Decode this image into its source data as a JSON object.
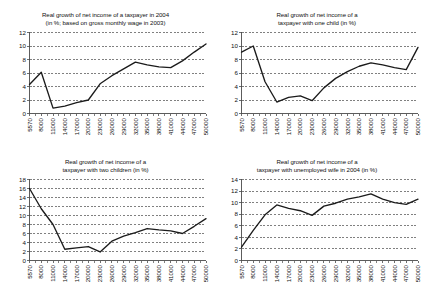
{
  "figure": {
    "background": "#ffffff",
    "line_color": "#1b1b1b",
    "axis_color": "#4a4a4a",
    "panel_count": 4
  },
  "chart_data": [
    {
      "type": "line",
      "panel": "top-left",
      "title": "Real growth of net income of a taxpayer in 2004\n(in %; based on gross monthly wage in 2003)",
      "title_line1": "Real growth of net income of a taxpayer in 2004",
      "title_line2": "(in %; based on gross monthly wage in 2003)",
      "xlabel": "",
      "ylabel": "",
      "grid": true,
      "legend": "none",
      "ylim": [
        0,
        12
      ],
      "yticks": [
        0,
        2,
        4,
        6,
        8,
        10,
        12
      ],
      "categories": [
        "5570",
        "8000",
        "11000",
        "14000",
        "17000",
        "20000",
        "23000",
        "26000",
        "29000",
        "32000",
        "35000",
        "38000",
        "41000",
        "44000",
        "47000",
        "50000"
      ],
      "values": [
        4.3,
        6.1,
        0.8,
        1.1,
        1.6,
        2.0,
        4.4,
        5.6,
        6.6,
        7.6,
        7.2,
        6.9,
        6.8,
        7.8,
        9.1,
        10.3
      ]
    },
    {
      "type": "line",
      "panel": "top-right",
      "title": "Real growth of net income of a\ntaxpayer with one child (in %)",
      "title_line1": "Real growth of net income of a",
      "title_line2": "taxpayer with one child (in %)",
      "xlabel": "",
      "ylabel": "",
      "grid": true,
      "legend": "none",
      "ylim": [
        0,
        12
      ],
      "yticks": [
        0,
        2,
        4,
        6,
        8,
        10,
        12
      ],
      "categories": [
        "5570",
        "8000",
        "11000",
        "14000",
        "17000",
        "20000",
        "23000",
        "26000",
        "29000",
        "32000",
        "35000",
        "38000",
        "41000",
        "44000",
        "47000",
        "50000"
      ],
      "values": [
        9.1,
        10.0,
        4.7,
        1.7,
        2.4,
        2.6,
        1.9,
        3.8,
        5.2,
        6.2,
        7.0,
        7.5,
        7.2,
        6.8,
        6.5,
        9.8
      ]
    },
    {
      "type": "line",
      "panel": "bottom-left",
      "title": "Real growth of net income of a\ntaxpayer with two children (in %)",
      "title_line1": "Real growth of net income of a",
      "title_line2": "taxpayer with two children (in %)",
      "xlabel": "",
      "ylabel": "",
      "grid": true,
      "legend": "none",
      "ylim": [
        0,
        18
      ],
      "yticks": [
        0,
        2,
        4,
        6,
        8,
        10,
        12,
        14,
        16,
        18
      ],
      "categories": [
        "5570",
        "8000",
        "11000",
        "14000",
        "17000",
        "20000",
        "23000",
        "26000",
        "29000",
        "32000",
        "35000",
        "38000",
        "41000",
        "44000",
        "47000",
        "50000"
      ],
      "values": [
        16.0,
        11.5,
        8.0,
        2.5,
        2.8,
        3.1,
        1.9,
        4.3,
        5.4,
        6.2,
        7.1,
        6.8,
        6.6,
        6.0,
        7.6,
        9.3
      ]
    },
    {
      "type": "line",
      "panel": "bottom-right",
      "title": "Real growth of net income of a\ntaxpayer with unemployed wife in 2004 (in %)",
      "title_line1": "Real growth of net income of a",
      "title_line2": "taxpayer with unemployed wife in 2004 (in %)",
      "xlabel": "",
      "ylabel": "",
      "grid": true,
      "legend": "none",
      "ylim": [
        0,
        14
      ],
      "yticks": [
        0,
        2,
        4,
        6,
        8,
        10,
        12,
        14
      ],
      "categories": [
        "5570",
        "8000",
        "11000",
        "14000",
        "17000",
        "20000",
        "23000",
        "26000",
        "29000",
        "32000",
        "35000",
        "38000",
        "41000",
        "44000",
        "47000",
        "50000"
      ],
      "values": [
        2.3,
        5.2,
        7.9,
        9.6,
        9.0,
        8.6,
        7.8,
        9.4,
        9.9,
        10.6,
        11.0,
        11.5,
        10.6,
        10.0,
        9.7,
        10.6,
        12.5
      ]
    }
  ]
}
